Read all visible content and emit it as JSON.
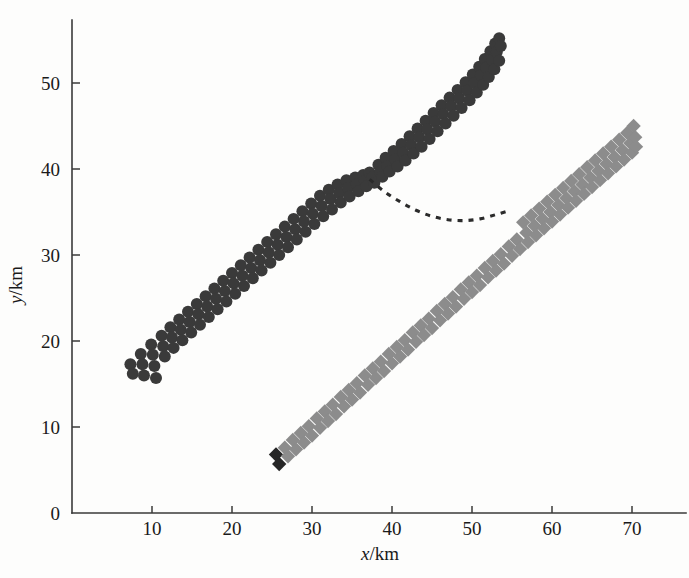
{
  "chart_data": {
    "type": "scatter",
    "title": "",
    "xlabel": "x/km",
    "ylabel": "y/km",
    "xlim": [
      0,
      75
    ],
    "ylim": [
      0,
      57
    ],
    "grid": false,
    "legend": "none",
    "xticks": [
      10,
      20,
      30,
      40,
      50,
      60,
      70
    ],
    "yticks": [
      0,
      10,
      20,
      30,
      40,
      50
    ],
    "series": [
      {
        "name": "dark-circles",
        "marker": "circle",
        "color": "#3a3a3a",
        "size": 12,
        "points": [
          [
            7.3,
            17.3
          ],
          [
            7.6,
            16.2
          ],
          [
            8.6,
            18.5
          ],
          [
            8.8,
            17.3
          ],
          [
            9.0,
            16.0
          ],
          [
            9.9,
            19.6
          ],
          [
            10.1,
            18.4
          ],
          [
            10.3,
            17.1
          ],
          [
            10.5,
            15.7
          ],
          [
            11.2,
            20.6
          ],
          [
            11.4,
            19.4
          ],
          [
            11.6,
            18.2
          ],
          [
            12.3,
            21.6
          ],
          [
            12.5,
            20.4
          ],
          [
            12.7,
            19.2
          ],
          [
            13.4,
            22.5
          ],
          [
            13.6,
            21.3
          ],
          [
            13.8,
            20.1
          ],
          [
            14.5,
            23.4
          ],
          [
            14.7,
            22.2
          ],
          [
            14.9,
            21.0
          ],
          [
            15.6,
            24.3
          ],
          [
            15.8,
            23.1
          ],
          [
            16.0,
            21.9
          ],
          [
            16.7,
            25.2
          ],
          [
            16.9,
            24.0
          ],
          [
            17.1,
            22.8
          ],
          [
            17.8,
            26.1
          ],
          [
            18.0,
            24.9
          ],
          [
            18.2,
            23.7
          ],
          [
            18.9,
            27.0
          ],
          [
            19.1,
            25.8
          ],
          [
            19.3,
            24.6
          ],
          [
            20.0,
            27.9
          ],
          [
            20.2,
            26.7
          ],
          [
            20.4,
            25.5
          ],
          [
            21.1,
            28.8
          ],
          [
            21.3,
            27.6
          ],
          [
            21.5,
            26.4
          ],
          [
            22.2,
            29.7
          ],
          [
            22.4,
            28.5
          ],
          [
            22.6,
            27.3
          ],
          [
            23.3,
            30.6
          ],
          [
            23.5,
            29.4
          ],
          [
            23.7,
            28.2
          ],
          [
            24.4,
            31.5
          ],
          [
            24.6,
            30.3
          ],
          [
            24.8,
            29.1
          ],
          [
            25.5,
            32.4
          ],
          [
            25.7,
            31.2
          ],
          [
            25.9,
            30.0
          ],
          [
            26.6,
            33.3
          ],
          [
            26.8,
            32.1
          ],
          [
            27.0,
            30.9
          ],
          [
            27.7,
            34.2
          ],
          [
            27.9,
            33.0
          ],
          [
            28.1,
            31.8
          ],
          [
            28.8,
            35.1
          ],
          [
            29.0,
            33.9
          ],
          [
            29.2,
            32.7
          ],
          [
            29.9,
            36.0
          ],
          [
            30.1,
            34.8
          ],
          [
            30.3,
            33.6
          ],
          [
            31.0,
            36.9
          ],
          [
            31.2,
            35.7
          ],
          [
            31.4,
            34.5
          ],
          [
            32.1,
            37.6
          ],
          [
            32.3,
            36.5
          ],
          [
            32.5,
            35.3
          ],
          [
            33.2,
            38.2
          ],
          [
            33.4,
            37.2
          ],
          [
            33.6,
            36.1
          ],
          [
            34.3,
            38.7
          ],
          [
            34.5,
            37.8
          ],
          [
            34.7,
            36.8
          ],
          [
            35.4,
            39.0
          ],
          [
            35.6,
            38.2
          ],
          [
            35.8,
            37.4
          ],
          [
            36.4,
            39.3
          ],
          [
            36.6,
            38.6
          ],
          [
            36.8,
            38.0
          ],
          [
            37.2,
            39.6
          ],
          [
            37.5,
            39.0
          ],
          [
            37.8,
            38.4
          ],
          [
            38.3,
            40.5
          ],
          [
            38.5,
            39.6
          ],
          [
            38.8,
            39.1
          ],
          [
            39.2,
            41.3
          ],
          [
            39.4,
            40.3
          ],
          [
            39.7,
            39.7
          ],
          [
            40.2,
            42.1
          ],
          [
            40.4,
            41.1
          ],
          [
            40.7,
            40.3
          ],
          [
            41.2,
            42.9
          ],
          [
            41.4,
            41.9
          ],
          [
            41.7,
            41.0
          ],
          [
            42.2,
            43.8
          ],
          [
            42.4,
            42.8
          ],
          [
            42.7,
            41.8
          ],
          [
            43.2,
            44.7
          ],
          [
            43.4,
            43.7
          ],
          [
            43.7,
            42.6
          ],
          [
            44.2,
            45.6
          ],
          [
            44.4,
            44.6
          ],
          [
            44.7,
            43.5
          ],
          [
            45.2,
            46.5
          ],
          [
            45.4,
            45.5
          ],
          [
            45.7,
            44.4
          ],
          [
            46.2,
            47.4
          ],
          [
            46.4,
            46.4
          ],
          [
            46.7,
            45.3
          ],
          [
            47.2,
            48.3
          ],
          [
            47.4,
            47.3
          ],
          [
            47.7,
            46.2
          ],
          [
            48.2,
            49.2
          ],
          [
            48.4,
            48.2
          ],
          [
            48.7,
            47.1
          ],
          [
            49.2,
            50.1
          ],
          [
            49.4,
            49.1
          ],
          [
            49.7,
            48.0
          ],
          [
            50.1,
            51.0
          ],
          [
            50.3,
            50.0
          ],
          [
            50.6,
            48.9
          ],
          [
            50.9,
            51.9
          ],
          [
            51.1,
            50.9
          ],
          [
            51.4,
            49.8
          ],
          [
            51.6,
            52.8
          ],
          [
            51.8,
            51.8
          ],
          [
            52.1,
            50.7
          ],
          [
            52.3,
            53.7
          ],
          [
            52.5,
            52.7
          ],
          [
            52.8,
            51.6
          ],
          [
            52.9,
            54.6
          ],
          [
            53.1,
            53.6
          ],
          [
            53.4,
            52.6
          ],
          [
            53.4,
            55.2
          ],
          [
            53.6,
            54.3
          ]
        ]
      },
      {
        "name": "gray-diamonds",
        "marker": "diamond",
        "color": "#8c8c8c",
        "size": 13,
        "dark_head_count": 2,
        "dark_head_color": "#262626",
        "points": [
          [
            25.5,
            6.8
          ],
          [
            25.9,
            5.7
          ],
          [
            26.6,
            7.6
          ],
          [
            27.0,
            6.6
          ],
          [
            27.6,
            8.5
          ],
          [
            28.0,
            7.4
          ],
          [
            28.6,
            9.3
          ],
          [
            29.0,
            8.2
          ],
          [
            29.6,
            10.1
          ],
          [
            30.0,
            9.0
          ],
          [
            30.6,
            11.0
          ],
          [
            31.0,
            9.9
          ],
          [
            31.6,
            11.8
          ],
          [
            32.0,
            10.7
          ],
          [
            32.6,
            12.6
          ],
          [
            33.0,
            11.5
          ],
          [
            33.6,
            13.5
          ],
          [
            34.0,
            12.4
          ],
          [
            34.6,
            14.3
          ],
          [
            35.0,
            13.2
          ],
          [
            35.6,
            15.1
          ],
          [
            36.0,
            14.0
          ],
          [
            36.6,
            16.0
          ],
          [
            37.0,
            14.9
          ],
          [
            37.6,
            16.8
          ],
          [
            38.0,
            15.7
          ],
          [
            38.6,
            17.6
          ],
          [
            39.0,
            16.5
          ],
          [
            39.6,
            18.5
          ],
          [
            40.0,
            17.4
          ],
          [
            40.6,
            19.3
          ],
          [
            41.0,
            18.2
          ],
          [
            41.6,
            20.1
          ],
          [
            42.0,
            19.0
          ],
          [
            42.6,
            21.0
          ],
          [
            43.0,
            19.9
          ],
          [
            43.6,
            21.8
          ],
          [
            44.0,
            20.7
          ],
          [
            44.6,
            22.6
          ],
          [
            45.0,
            21.5
          ],
          [
            45.6,
            23.5
          ],
          [
            46.0,
            22.4
          ],
          [
            46.6,
            24.3
          ],
          [
            47.0,
            23.2
          ],
          [
            47.6,
            25.1
          ],
          [
            48.0,
            24.0
          ],
          [
            48.6,
            26.0
          ],
          [
            49.0,
            24.9
          ],
          [
            49.6,
            26.8
          ],
          [
            50.0,
            25.7
          ],
          [
            50.6,
            27.6
          ],
          [
            51.0,
            26.5
          ],
          [
            51.6,
            28.5
          ],
          [
            52.0,
            27.4
          ],
          [
            52.6,
            29.3
          ],
          [
            53.0,
            28.2
          ],
          [
            53.6,
            30.1
          ],
          [
            54.0,
            29.0
          ],
          [
            54.6,
            31.0
          ],
          [
            55.0,
            29.9
          ],
          [
            55.6,
            31.8
          ],
          [
            56.0,
            30.7
          ],
          [
            56.4,
            33.8
          ],
          [
            56.8,
            32.6
          ],
          [
            57.0,
            31.5
          ],
          [
            57.4,
            34.6
          ],
          [
            57.8,
            33.4
          ],
          [
            58.0,
            32.3
          ],
          [
            58.4,
            35.4
          ],
          [
            58.8,
            34.2
          ],
          [
            59.0,
            33.1
          ],
          [
            59.4,
            36.2
          ],
          [
            59.8,
            35.0
          ],
          [
            60.0,
            33.9
          ],
          [
            60.4,
            37.0
          ],
          [
            60.8,
            35.8
          ],
          [
            61.0,
            34.7
          ],
          [
            61.4,
            37.8
          ],
          [
            61.8,
            36.6
          ],
          [
            62.0,
            35.5
          ],
          [
            62.4,
            38.6
          ],
          [
            62.8,
            37.4
          ],
          [
            63.0,
            36.3
          ],
          [
            63.4,
            39.4
          ],
          [
            63.8,
            38.2
          ],
          [
            64.0,
            37.1
          ],
          [
            64.4,
            40.2
          ],
          [
            64.8,
            39.0
          ],
          [
            65.0,
            37.9
          ],
          [
            65.4,
            41.0
          ],
          [
            65.8,
            39.8
          ],
          [
            66.0,
            38.7
          ],
          [
            66.4,
            41.8
          ],
          [
            66.8,
            40.6
          ],
          [
            67.0,
            39.5
          ],
          [
            67.4,
            42.6
          ],
          [
            67.8,
            41.4
          ],
          [
            68.0,
            40.3
          ],
          [
            68.4,
            43.4
          ],
          [
            68.8,
            42.2
          ],
          [
            69.0,
            41.1
          ],
          [
            69.4,
            44.2
          ],
          [
            69.8,
            43.0
          ],
          [
            70.0,
            41.9
          ],
          [
            70.2,
            45.0
          ],
          [
            70.4,
            43.7
          ],
          [
            70.5,
            42.6
          ]
        ]
      }
    ],
    "annotations": [
      {
        "name": "dashed-transition-curve",
        "style": "dashed",
        "color": "#2b2b2b",
        "path_points": [
          [
            37.2,
            38.8
          ],
          [
            39.0,
            37.4
          ],
          [
            41.0,
            36.2
          ],
          [
            43.0,
            35.2
          ],
          [
            45.0,
            34.5
          ],
          [
            47.0,
            34.1
          ],
          [
            49.0,
            34.0
          ],
          [
            51.0,
            34.2
          ],
          [
            53.0,
            34.7
          ],
          [
            54.8,
            35.2
          ]
        ]
      }
    ]
  }
}
